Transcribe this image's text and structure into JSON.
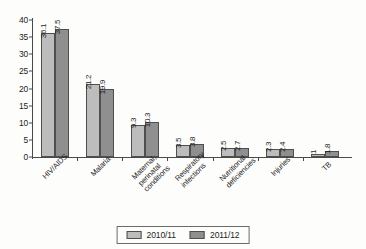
{
  "chart_data": {
    "type": "bar",
    "title": "",
    "subtitle": "",
    "xlabel": "",
    "ylabel": "",
    "ylim": [
      0,
      40
    ],
    "yticks": [
      0,
      5,
      10,
      15,
      20,
      25,
      30,
      35,
      40
    ],
    "ytick_labels": [
      "0",
      "5",
      "10",
      "15",
      "20",
      "25",
      "30",
      "35",
      "40"
    ],
    "grid": false,
    "legend_position": "bottom",
    "orientation": "vertical",
    "grouping": "clustered",
    "categories": [
      "HIV/AIDS",
      "Malaria",
      "Maternal, perinatal conditions",
      "Respiratory infections",
      "Nutritional deficiencies",
      "Injuries",
      "TB"
    ],
    "category_label_lines": [
      [
        "HIV/AIDS"
      ],
      [
        "Malaria"
      ],
      [
        "Maternal, perinatal",
        "conditions"
      ],
      [
        "Respiratory",
        "infections"
      ],
      [
        "Nutritional",
        "deficiencies"
      ],
      [
        "Injuries"
      ],
      [
        "TB"
      ]
    ],
    "series": [
      {
        "name": "2010/11",
        "color": "#bdbdbd",
        "values": [
          36.1,
          21.2,
          9.3,
          3.5,
          2.5,
          2.3,
          1
        ],
        "value_labels": [
          "36.1",
          "21.2",
          "9.3",
          "3.5",
          "2.5",
          "2.3",
          "1"
        ]
      },
      {
        "name": "2011/12",
        "color": "#8f8f8f",
        "values": [
          37.5,
          19.9,
          10.3,
          3.8,
          2.7,
          2.4,
          1.8
        ],
        "value_labels": [
          "37.5",
          "19.9",
          "10.3",
          "3.8",
          "2.7",
          "2.4",
          "1.8"
        ]
      }
    ],
    "legend": [
      {
        "label": "2010/11",
        "color": "#bdbdbd"
      },
      {
        "label": "2011/12",
        "color": "#8f8f8f"
      }
    ]
  }
}
